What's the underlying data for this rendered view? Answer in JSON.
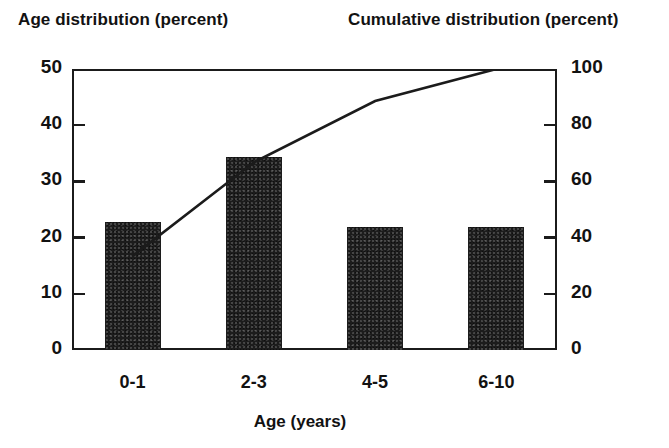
{
  "chart_data": {
    "type": "bar",
    "title": "",
    "left_axis_title": "Age distribution (percent)",
    "right_axis_title": "Cumulative distribution (percent)",
    "xlabel": "Age (years)",
    "ylabel": "Age distribution (percent)",
    "y2label": "Cumulative distribution (percent)",
    "categories": [
      "0-1",
      "2-3",
      "4-5",
      "6-10"
    ],
    "values": [
      22.8,
      34.3,
      21.8,
      21.8
    ],
    "ylim": [
      0,
      50
    ],
    "y2lim": [
      0,
      100
    ],
    "yticks": [
      "0",
      "10",
      "20",
      "30",
      "40",
      "50"
    ],
    "ytick_values": [
      0,
      10,
      20,
      30,
      40,
      50
    ],
    "y2ticks": [
      "0",
      "20",
      "40",
      "60",
      "80",
      "100"
    ],
    "y2tick_values": [
      0,
      20,
      40,
      60,
      80,
      100
    ],
    "grid": false,
    "legend": "none",
    "series": [
      {
        "name": "Age distribution (percent)",
        "type": "bar",
        "axis": "left",
        "values": [
          22.8,
          34.3,
          21.8,
          21.8
        ],
        "color": "#1c1c1c"
      },
      {
        "name": "Cumulative distribution (percent)",
        "type": "line",
        "axis": "right",
        "values": [
          33.4,
          66.8,
          88.6,
          100.0
        ],
        "color": "#1b1b1b"
      }
    ]
  },
  "colors": {
    "bar_fill": "#1c1c1c",
    "axis": "#1b1b1b",
    "line": "#1b1b1b",
    "background": "#ffffff",
    "text": "#121212"
  }
}
